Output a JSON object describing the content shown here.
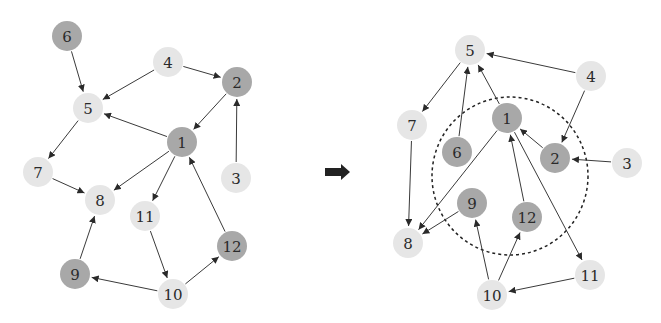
{
  "colors": {
    "light_node": "#e6e6e6",
    "dark_node": "#a8a8a8",
    "edge": "#3a3a3a",
    "arrow": "#222222",
    "background": "#ffffff"
  },
  "node_radius": 15,
  "graphs": [
    {
      "id": "before",
      "nodes": [
        {
          "id": "1",
          "label": "1",
          "x": 182,
          "y": 142,
          "shade": "dark"
        },
        {
          "id": "2",
          "label": "2",
          "x": 237,
          "y": 82,
          "shade": "dark"
        },
        {
          "id": "3",
          "label": "3",
          "x": 236,
          "y": 178,
          "shade": "light"
        },
        {
          "id": "4",
          "label": "4",
          "x": 168,
          "y": 62,
          "shade": "light"
        },
        {
          "id": "5",
          "label": "5",
          "x": 88,
          "y": 108,
          "shade": "light"
        },
        {
          "id": "6",
          "label": "6",
          "x": 67,
          "y": 36,
          "shade": "dark"
        },
        {
          "id": "7",
          "label": "7",
          "x": 38,
          "y": 172,
          "shade": "light"
        },
        {
          "id": "8",
          "label": "8",
          "x": 100,
          "y": 200,
          "shade": "light"
        },
        {
          "id": "9",
          "label": "9",
          "x": 75,
          "y": 274,
          "shade": "dark"
        },
        {
          "id": "10",
          "label": "10",
          "x": 173,
          "y": 294,
          "shade": "light"
        },
        {
          "id": "11",
          "label": "11",
          "x": 145,
          "y": 216,
          "shade": "light"
        },
        {
          "id": "12",
          "label": "12",
          "x": 232,
          "y": 246,
          "shade": "dark"
        }
      ],
      "edges": [
        {
          "from": "6",
          "to": "5"
        },
        {
          "from": "4",
          "to": "5"
        },
        {
          "from": "4",
          "to": "2"
        },
        {
          "from": "2",
          "to": "1"
        },
        {
          "from": "3",
          "to": "2"
        },
        {
          "from": "1",
          "to": "5"
        },
        {
          "from": "1",
          "to": "8"
        },
        {
          "from": "1",
          "to": "11"
        },
        {
          "from": "5",
          "to": "7"
        },
        {
          "from": "7",
          "to": "8"
        },
        {
          "from": "9",
          "to": "8"
        },
        {
          "from": "11",
          "to": "10"
        },
        {
          "from": "10",
          "to": "9"
        },
        {
          "from": "10",
          "to": "12"
        },
        {
          "from": "12",
          "to": "1"
        }
      ]
    },
    {
      "id": "after",
      "cluster": {
        "cx": 510,
        "cy": 176,
        "rx": 78,
        "ry": 79,
        "style": "dashed"
      },
      "nodes": [
        {
          "id": "1",
          "label": "1",
          "x": 507,
          "y": 118,
          "shade": "dark"
        },
        {
          "id": "2",
          "label": "2",
          "x": 555,
          "y": 158,
          "shade": "dark"
        },
        {
          "id": "3",
          "label": "3",
          "x": 627,
          "y": 163,
          "shade": "light"
        },
        {
          "id": "4",
          "label": "4",
          "x": 591,
          "y": 76,
          "shade": "light"
        },
        {
          "id": "5",
          "label": "5",
          "x": 470,
          "y": 50,
          "shade": "light"
        },
        {
          "id": "6",
          "label": "6",
          "x": 457,
          "y": 152,
          "shade": "dark"
        },
        {
          "id": "7",
          "label": "7",
          "x": 412,
          "y": 125,
          "shade": "light"
        },
        {
          "id": "8",
          "label": "8",
          "x": 408,
          "y": 243,
          "shade": "light"
        },
        {
          "id": "9",
          "label": "9",
          "x": 472,
          "y": 203,
          "shade": "dark"
        },
        {
          "id": "10",
          "label": "10",
          "x": 492,
          "y": 295,
          "shade": "light"
        },
        {
          "id": "11",
          "label": "11",
          "x": 590,
          "y": 275,
          "shade": "light"
        },
        {
          "id": "12",
          "label": "12",
          "x": 527,
          "y": 217,
          "shade": "dark"
        }
      ],
      "edges": [
        {
          "from": "4",
          "to": "5"
        },
        {
          "from": "4",
          "to": "2"
        },
        {
          "from": "3",
          "to": "2"
        },
        {
          "from": "2",
          "to": "1"
        },
        {
          "from": "1",
          "to": "5"
        },
        {
          "from": "6",
          "to": "5"
        },
        {
          "from": "5",
          "to": "7"
        },
        {
          "from": "7",
          "to": "8"
        },
        {
          "from": "1",
          "to": "8"
        },
        {
          "from": "9",
          "to": "8"
        },
        {
          "from": "1",
          "to": "11"
        },
        {
          "from": "12",
          "to": "1"
        },
        {
          "from": "10",
          "to": "9"
        },
        {
          "from": "10",
          "to": "12"
        },
        {
          "from": "11",
          "to": "10"
        }
      ]
    }
  ],
  "transition_arrow": {
    "x1": 325,
    "x2": 350,
    "y": 172,
    "icon": "right-arrow-icon"
  }
}
